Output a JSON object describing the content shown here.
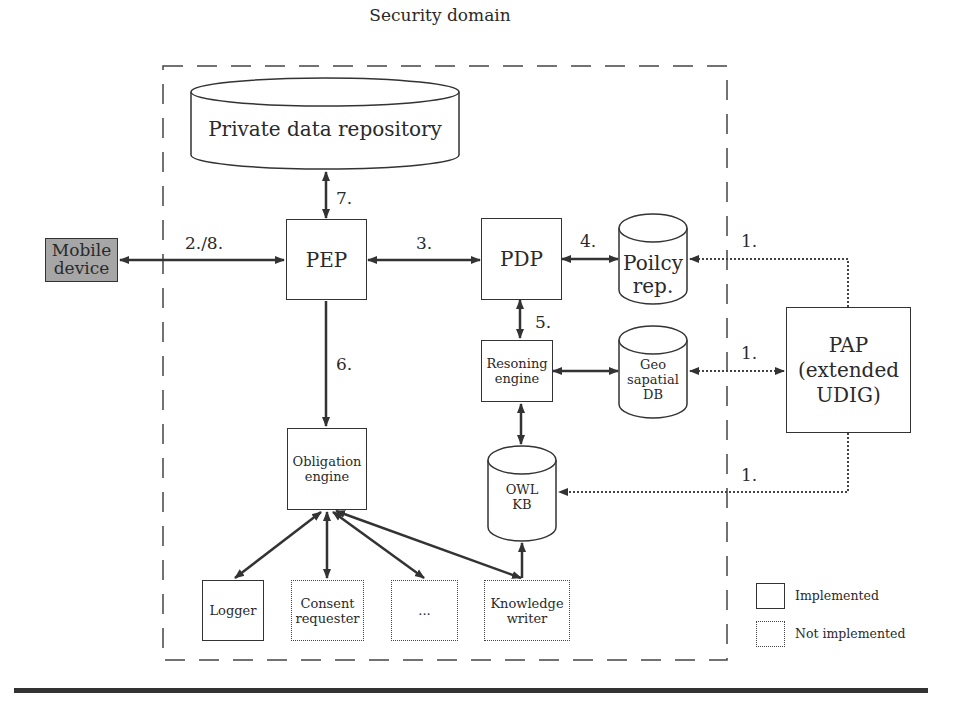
{
  "diagram": {
    "domain_label": "Security domain",
    "mobile_device": "Mobile device",
    "private_repo": "Private data repository",
    "pep": "PEP",
    "pdp": "PDP",
    "policy_rep_line1": "Poilcy",
    "policy_rep_line2": "rep.",
    "reasoning_line1": "Resoning",
    "reasoning_line2": "engine",
    "geo_line1": "Geo",
    "geo_line2": "sapatial",
    "geo_line3": "DB",
    "pap_line1": "PAP",
    "pap_line2": "(extended",
    "pap_line3": "UDIG)",
    "owl_line1": "OWL",
    "owl_line2": "KB",
    "obligation_line1": "Obligation",
    "obligation_line2": "engine",
    "logger": "Logger",
    "consent_line1": "Consent",
    "consent_line2": "requester",
    "ellipsis": "...",
    "knowledge_line1": "Knowledge",
    "knowledge_line2": "writer"
  },
  "edges": {
    "e_2_8": "2./8.",
    "e_3": "3.",
    "e_4": "4.",
    "e_5": "5.",
    "e_6": "6.",
    "e_7": "7.",
    "e_1a": "1.",
    "e_1b": "1.",
    "e_1c": "1."
  },
  "legend": {
    "implemented": "Implemented",
    "not_implemented": "Not implemented"
  },
  "colors": {
    "line": "#333333",
    "mobile_fill": "#a6a6a6"
  }
}
